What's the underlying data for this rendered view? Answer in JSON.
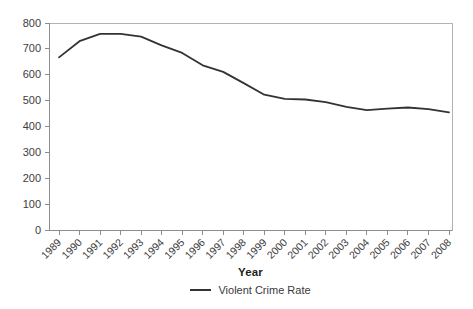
{
  "chart_data": {
    "type": "line",
    "title": "",
    "xlabel": "Year",
    "ylabel": "",
    "categories": [
      1989,
      1990,
      1991,
      1992,
      1993,
      1994,
      1995,
      1996,
      1997,
      1998,
      1999,
      2000,
      2001,
      2002,
      2003,
      2004,
      2005,
      2006,
      2007,
      2008
    ],
    "series": [
      {
        "name": "Violent Crime Rate",
        "color": "#333333",
        "values": [
          666.9,
          729.6,
          758.2,
          757.7,
          747.1,
          713.6,
          684.5,
          636.6,
          611.0,
          567.6,
          523.0,
          506.5,
          504.5,
          494.4,
          475.8,
          463.2,
          469.0,
          473.6,
          466.9,
          454.5
        ]
      }
    ],
    "ylim": [
      0,
      800
    ],
    "ytick_step": 100,
    "grid": false,
    "frame": true,
    "legend_position": "bottom-center",
    "styles": {
      "frame_color": "#b3b3b3",
      "axis_color": "#8c8c8c",
      "tick_label_color": "#3d3d3d",
      "background": "#ffffff"
    }
  }
}
